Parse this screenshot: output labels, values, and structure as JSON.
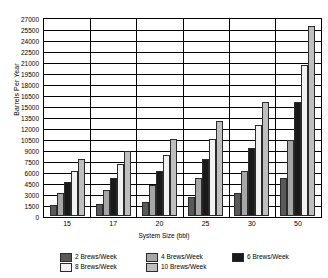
{
  "chart_data": {
    "type": "bar",
    "title": "",
    "xlabel": "System Size (bbl)",
    "ylabel": "Barrels Per Year",
    "categories": [
      "15",
      "17",
      "20",
      "25",
      "30",
      "50"
    ],
    "ylim": [
      0,
      27000
    ],
    "ytick_step": 1500,
    "yticks": [
      "27000",
      "25500",
      "24000",
      "22500",
      "21000",
      "19500",
      "18000",
      "16500",
      "15000",
      "13500",
      "12000",
      "10500",
      "9000",
      "7500",
      "6000",
      "4500",
      "3000",
      "1500",
      "0"
    ],
    "grid": true,
    "legend_position": "bottom",
    "series": [
      {
        "name": "2 Brews/Week",
        "color": "#595959",
        "values": [
          1550,
          1700,
          1950,
          2600,
          3100,
          5150
        ]
      },
      {
        "name": "4 Brews/Week",
        "color": "#a6a6a6",
        "values": [
          3100,
          3500,
          4250,
          5150,
          6200,
          10400
        ]
      },
      {
        "name": "6 Brews/Week",
        "color": "#1a1a1a",
        "values": [
          4650,
          5250,
          6200,
          7750,
          9300,
          15500
        ]
      },
      {
        "name": "8 Brews/Week",
        "color": "#f2f2f2",
        "values": [
          6200,
          7050,
          8300,
          10450,
          12450,
          20650
        ]
      },
      {
        "name": "10 Brews/Week",
        "color": "#bfbfbf",
        "values": [
          7800,
          8800,
          10450,
          13000,
          15500,
          25850
        ]
      }
    ]
  }
}
